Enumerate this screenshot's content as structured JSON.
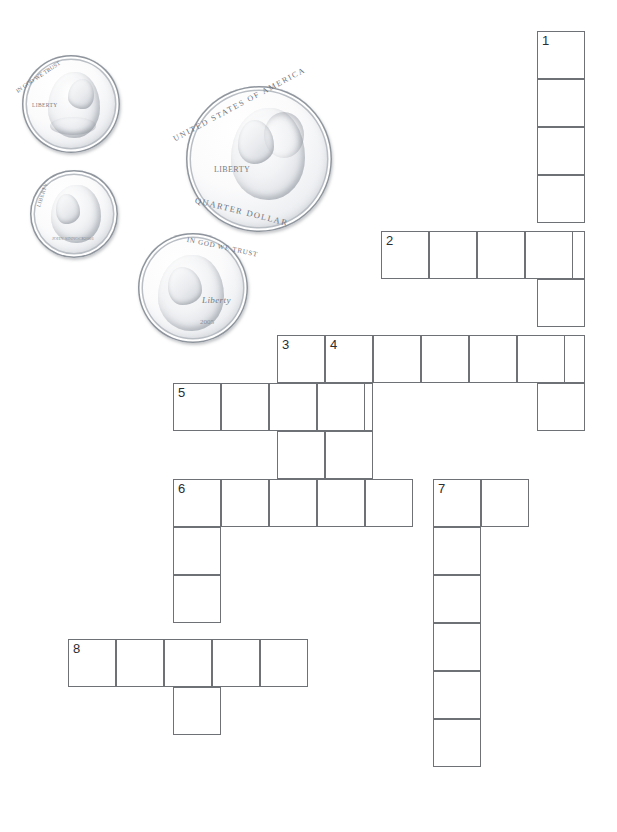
{
  "page": {
    "width": 617,
    "height": 832,
    "background": "#ffffff",
    "grid_line_color": "#6e7277",
    "cell_size": 48
  },
  "illustration": {
    "name": "us-coins-group",
    "coins": [
      {
        "name": "penny",
        "denomination": "Penny",
        "value_cents": 1,
        "obverse_figure": "Abraham Lincoln",
        "motto": "IN GOD WE TRUST",
        "liberty": "LIBERTY",
        "date": "",
        "x": 22,
        "y": 55,
        "size": 98
      },
      {
        "name": "dime",
        "denomination": "Dime",
        "value_cents": 10,
        "obverse_figure": "Franklin D. Roosevelt",
        "motto": "",
        "liberty": "LIBERTY",
        "date": "2001",
        "x": 30,
        "y": 170,
        "size": 88
      },
      {
        "name": "quarter",
        "denomination": "Quarter",
        "value_cents": 25,
        "obverse_figure": "George Washington",
        "motto": "UNITED STATES OF AMERICA",
        "liberty": "LIBERTY",
        "legend": "QUARTER DOLLAR",
        "date": "",
        "x": 186,
        "y": 86,
        "size": 146
      },
      {
        "name": "nickel",
        "denomination": "Nickel",
        "value_cents": 5,
        "obverse_figure": "Thomas Jefferson",
        "motto": "IN GOD WE TRUST",
        "liberty": "Liberty",
        "date": "2005",
        "x": 138,
        "y": 233,
        "size": 110
      }
    ]
  },
  "crossword": {
    "name": "coin-crossword-grid",
    "clue_numbers": [
      1,
      2,
      3,
      4,
      5,
      6,
      7,
      8
    ],
    "entries": [
      {
        "number": 1,
        "direction": "down",
        "length": 8,
        "start": {
          "x": 537,
          "y": 31
        },
        "cells": [
          {
            "x": 537,
            "y": 31,
            "num": "1"
          },
          {
            "x": 537,
            "y": 79,
            "num": ""
          },
          {
            "x": 537,
            "y": 127,
            "num": ""
          },
          {
            "x": 537,
            "y": 175,
            "num": ""
          },
          {
            "x": 537,
            "y": 231,
            "num": ""
          },
          {
            "x": 537,
            "y": 279,
            "num": ""
          },
          {
            "x": 537,
            "y": 335,
            "num": ""
          },
          {
            "x": 537,
            "y": 383,
            "num": ""
          }
        ]
      },
      {
        "number": 2,
        "direction": "across",
        "length": 4,
        "start": {
          "x": 381,
          "y": 231
        },
        "cells": [
          {
            "x": 381,
            "y": 231,
            "num": "2"
          },
          {
            "x": 429,
            "y": 231,
            "num": ""
          },
          {
            "x": 477,
            "y": 231,
            "num": ""
          },
          {
            "x": 525,
            "y": 231,
            "num": ""
          }
        ]
      },
      {
        "number": 3,
        "direction": "across",
        "length": 6,
        "start": {
          "x": 277,
          "y": 335
        },
        "cells": [
          {
            "x": 277,
            "y": 335,
            "num": "3"
          },
          {
            "x": 325,
            "y": 335,
            "num": "4"
          },
          {
            "x": 373,
            "y": 335,
            "num": ""
          },
          {
            "x": 421,
            "y": 335,
            "num": ""
          },
          {
            "x": 469,
            "y": 335,
            "num": ""
          },
          {
            "x": 517,
            "y": 335,
            "num": ""
          }
        ]
      },
      {
        "number": 3,
        "direction": "down",
        "length": 4,
        "start": {
          "x": 277,
          "y": 335
        },
        "cells": [
          {
            "x": 277,
            "y": 383,
            "num": ""
          },
          {
            "x": 277,
            "y": 431,
            "num": ""
          },
          {
            "x": 277,
            "y": 479,
            "num": ""
          }
        ]
      },
      {
        "number": 4,
        "direction": "down",
        "length": 4,
        "start": {
          "x": 325,
          "y": 335
        },
        "cells": [
          {
            "x": 325,
            "y": 383,
            "num": ""
          },
          {
            "x": 325,
            "y": 431,
            "num": ""
          },
          {
            "x": 325,
            "y": 479,
            "num": ""
          }
        ]
      },
      {
        "number": 5,
        "direction": "across",
        "length": 4,
        "start": {
          "x": 173,
          "y": 383
        },
        "cells": [
          {
            "x": 173,
            "y": 383,
            "num": "5"
          },
          {
            "x": 221,
            "y": 383,
            "num": ""
          },
          {
            "x": 269,
            "y": 383,
            "num": ""
          },
          {
            "x": 317,
            "y": 383,
            "num": ""
          }
        ]
      },
      {
        "number": 6,
        "direction": "across",
        "length": 7,
        "start": {
          "x": 173,
          "y": 479
        },
        "cells": [
          {
            "x": 173,
            "y": 479,
            "num": "6"
          },
          {
            "x": 221,
            "y": 479,
            "num": ""
          },
          {
            "x": 269,
            "y": 479,
            "num": ""
          },
          {
            "x": 317,
            "y": 479,
            "num": ""
          },
          {
            "x": 365,
            "y": 479,
            "num": ""
          },
          {
            "x": 433,
            "y": 479,
            "num": "7"
          },
          {
            "x": 481,
            "y": 479,
            "num": ""
          }
        ]
      },
      {
        "number": 6,
        "direction": "down",
        "length": 6,
        "start": {
          "x": 173,
          "y": 479
        },
        "cells": [
          {
            "x": 173,
            "y": 527,
            "num": ""
          },
          {
            "x": 173,
            "y": 575,
            "num": ""
          },
          {
            "x": 173,
            "y": 639,
            "num": ""
          },
          {
            "x": 173,
            "y": 687,
            "num": ""
          }
        ]
      },
      {
        "number": 7,
        "direction": "down",
        "length": 7,
        "start": {
          "x": 433,
          "y": 479
        },
        "cells": [
          {
            "x": 433,
            "y": 527,
            "num": ""
          },
          {
            "x": 433,
            "y": 575,
            "num": ""
          },
          {
            "x": 433,
            "y": 623,
            "num": ""
          },
          {
            "x": 433,
            "y": 671,
            "num": ""
          },
          {
            "x": 433,
            "y": 719,
            "num": ""
          }
        ]
      },
      {
        "number": 8,
        "direction": "across",
        "length": 5,
        "start": {
          "x": 68,
          "y": 639
        },
        "cells": [
          {
            "x": 68,
            "y": 639,
            "num": "8"
          },
          {
            "x": 116,
            "y": 639,
            "num": ""
          },
          {
            "x": 164,
            "y": 639,
            "num": ""
          },
          {
            "x": 212,
            "y": 639,
            "num": ""
          },
          {
            "x": 260,
            "y": 639,
            "num": ""
          }
        ]
      },
      {
        "number": 0,
        "direction": "extra",
        "length": 1,
        "start": {
          "x": 173,
          "y": 687
        },
        "cells": [
          {
            "x": 173,
            "y": 687,
            "num": ""
          }
        ]
      }
    ]
  }
}
